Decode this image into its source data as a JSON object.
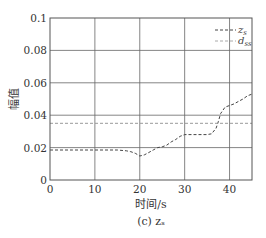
{
  "chart_data": {
    "type": "line",
    "title": "",
    "caption": "(c) z_s",
    "xlabel": "时间/s",
    "ylabel": "幅值",
    "xlim": [
      0,
      45
    ],
    "ylim": [
      0,
      0.1
    ],
    "xticks": [
      0,
      10,
      20,
      30,
      40
    ],
    "xtick_labels": [
      "0",
      "10",
      "20",
      "30",
      "40"
    ],
    "yticks": [
      0,
      0.02,
      0.04,
      0.06,
      0.08,
      0.1
    ],
    "ytick_labels": [
      "0",
      "0.02",
      "0.04",
      "0.06",
      "0.08",
      "0.1"
    ],
    "grid": true,
    "legend_position": "upper right",
    "series": [
      {
        "name": "z_s",
        "style": "dashed",
        "color": "#444444",
        "x": [
          0,
          5,
          10,
          15,
          17,
          18,
          19,
          20,
          21,
          22,
          23,
          24,
          25,
          26,
          27,
          28,
          29,
          30,
          32,
          34,
          35,
          36,
          37,
          37.5,
          38,
          39,
          40,
          41,
          42,
          43,
          44,
          45
        ],
        "y": [
          0.0185,
          0.0185,
          0.0185,
          0.0185,
          0.018,
          0.0175,
          0.0165,
          0.0148,
          0.0155,
          0.017,
          0.0185,
          0.02,
          0.0205,
          0.0215,
          0.0235,
          0.025,
          0.027,
          0.028,
          0.028,
          0.028,
          0.028,
          0.0285,
          0.032,
          0.036,
          0.041,
          0.045,
          0.046,
          0.047,
          0.0485,
          0.05,
          0.052,
          0.053
        ]
      },
      {
        "name": "d_ss",
        "style": "dashed",
        "color": "#999999",
        "x": [
          0,
          45
        ],
        "y": [
          0.035,
          0.035
        ]
      }
    ]
  },
  "legend": {
    "items": [
      {
        "label_main": "z",
        "label_sub": "s"
      },
      {
        "label_main": "d",
        "label_sub": "ss"
      }
    ]
  },
  "axes": {
    "xlabel": "时间/s",
    "ylabel": "幅值",
    "caption": "(c) zₛ"
  }
}
